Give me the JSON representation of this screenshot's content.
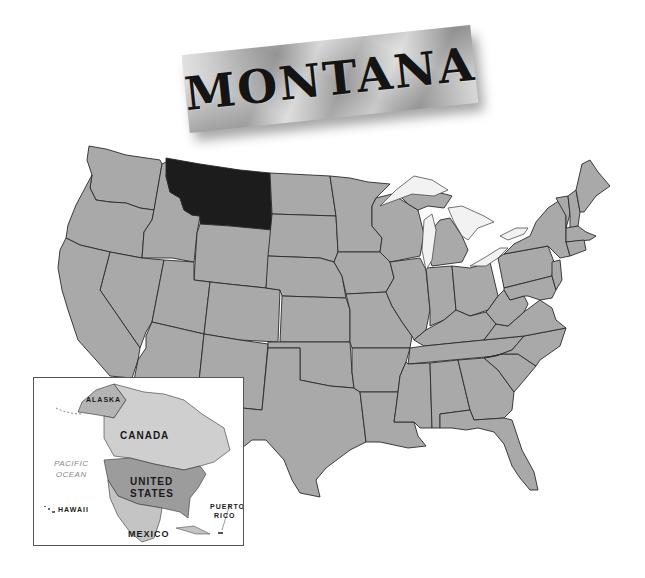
{
  "title": {
    "text": "MONTANA"
  },
  "main_map": {
    "highlighted_state": "Montana",
    "colors": {
      "state_fill": "#a9a9a9",
      "highlight_fill": "#1c1c1c",
      "lake_fill": "#f2f2f2",
      "border": "#2a2a2a"
    }
  },
  "inset_map": {
    "labels": {
      "alaska": "ALASKA",
      "canada": "CANADA",
      "united_states_line1": "UNITED",
      "united_states_line2": "STATES",
      "mexico": "MEXICO",
      "hawaii": "HAWAII",
      "puerto_rico_line1": "PUERTO",
      "puerto_rico_line2": "RICO",
      "ocean_line1": "PACIFIC",
      "ocean_line2": "OCEAN"
    },
    "colors": {
      "canada_fill": "#cfcfcf",
      "us_fill": "#9c9c9c",
      "mexico_fill": "#c4c4c4",
      "water": "#ffffff"
    }
  }
}
